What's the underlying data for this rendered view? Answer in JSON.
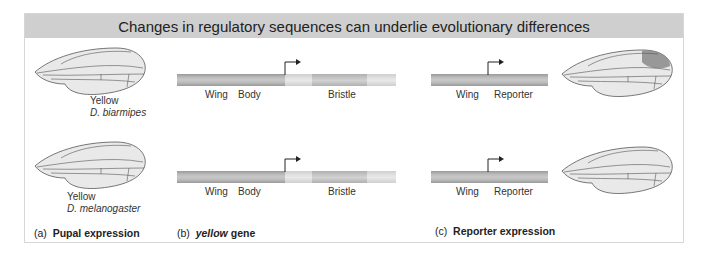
{
  "title": "Changes in regulatory sequences can underlie evolutionary differences",
  "panels": {
    "a": {
      "letter": "(a)",
      "caption": "Pupal expression"
    },
    "b": {
      "letter": "(b)",
      "caption_italic": "yellow",
      "caption": " gene"
    },
    "c": {
      "letter": "(c)",
      "caption": "Reporter expression"
    }
  },
  "rows": [
    {
      "gene_label": "Yellow",
      "species": "D. biarmipes",
      "gene_segments": [
        "Wing",
        "Body",
        "Bristle"
      ],
      "reporter_segments": [
        "Wing",
        "Reporter"
      ],
      "wing_spot": true
    },
    {
      "gene_label": "Yellow",
      "species": "D. melanogaster",
      "gene_segments": [
        "Wing",
        "Body",
        "Bristle"
      ],
      "reporter_segments": [
        "Wing",
        "Reporter"
      ],
      "wing_spot": false
    }
  ],
  "colors": {
    "banner": "#cfcfcf",
    "wing_fill": "#e9e9e9",
    "wing_outline": "#555555",
    "spot": "#8a8a8a"
  }
}
